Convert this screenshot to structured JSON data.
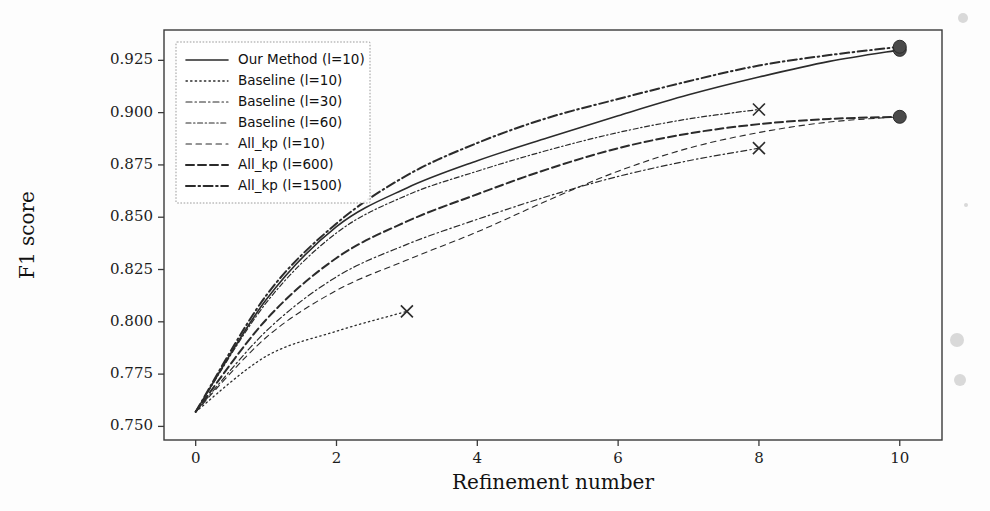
{
  "figure": {
    "background": "#fdfdfd",
    "ink_color": "#2b2b2b"
  },
  "chart_data": {
    "type": "line",
    "title": "",
    "xlabel": "Refinement number",
    "ylabel": "F1 score",
    "xlim": [
      -0.45,
      10.6
    ],
    "ylim": [
      0.7435,
      0.9395
    ],
    "xticks": [
      0,
      2,
      4,
      6,
      8,
      10
    ],
    "xticklabels": [
      "0",
      "2",
      "4",
      "6",
      "8",
      "10"
    ],
    "yticks": [
      0.75,
      0.775,
      0.8,
      0.825,
      0.85,
      0.875,
      0.9,
      0.925
    ],
    "yticklabels": [
      "0.750",
      "0.775",
      "0.800",
      "0.825",
      "0.850",
      "0.875",
      "0.900",
      "0.925"
    ],
    "grid": false,
    "legend_position": "upper left",
    "series": [
      {
        "name": "Our Method (l=10)",
        "dash": "none",
        "width": 1.6,
        "marker": "circle",
        "marker_x": [
          10
        ],
        "x": [
          0,
          1,
          2,
          3,
          4,
          5,
          6,
          7,
          8,
          9,
          10
        ],
        "y": [
          0.757,
          0.8105,
          0.8455,
          0.864,
          0.877,
          0.888,
          0.8985,
          0.9085,
          0.917,
          0.9245,
          0.93
        ]
      },
      {
        "name": "Baseline (l=10)",
        "dash": "1.4 3.2",
        "width": 1.3,
        "marker": "x",
        "marker_x": [
          3
        ],
        "x": [
          0,
          1,
          2,
          3
        ],
        "y": [
          0.757,
          0.7835,
          0.7955,
          0.805
        ]
      },
      {
        "name": "Baseline (l=30)",
        "dash": "6 3 1.5 3",
        "width": 1.2,
        "marker": "x",
        "marker_x": [
          8
        ],
        "x": [
          0,
          1,
          2,
          3,
          4,
          5,
          6,
          7,
          8
        ],
        "y": [
          0.757,
          0.7955,
          0.8215,
          0.837,
          0.849,
          0.86,
          0.8695,
          0.877,
          0.883
        ]
      },
      {
        "name": "Baseline (l=60)",
        "dash": "5 2.6 1.4 2.6",
        "width": 1.2,
        "marker": "x",
        "marker_x": [
          8
        ],
        "x": [
          0,
          1,
          2,
          3,
          4,
          5,
          6,
          7,
          8
        ],
        "y": [
          0.757,
          0.809,
          0.8425,
          0.8605,
          0.872,
          0.882,
          0.8905,
          0.897,
          0.9015
        ]
      },
      {
        "name": "All_kp (l=10)",
        "dash": "5.5 4.5",
        "width": 1.1,
        "marker": "none",
        "marker_x": [],
        "x": [
          0,
          1,
          2,
          3,
          4,
          5,
          6,
          7,
          8,
          9,
          10
        ],
        "y": [
          0.757,
          0.7925,
          0.815,
          0.8295,
          0.843,
          0.858,
          0.872,
          0.883,
          0.8905,
          0.8955,
          0.898
        ]
      },
      {
        "name": "All_kp (l=600)",
        "dash": "8 4",
        "width": 2.0,
        "marker": "circle",
        "marker_x": [
          10
        ],
        "x": [
          0,
          1,
          2,
          3,
          4,
          5,
          6,
          7,
          8,
          9,
          10
        ],
        "y": [
          0.757,
          0.801,
          0.8305,
          0.848,
          0.861,
          0.873,
          0.883,
          0.89,
          0.8945,
          0.897,
          0.898
        ]
      },
      {
        "name": "All_kp (l=1500)",
        "dash": "9 3.5 1.6 3.5",
        "width": 2.0,
        "marker": "circle",
        "marker_x": [
          10
        ],
        "x": [
          0,
          1,
          2,
          3,
          4,
          5,
          6,
          7,
          8,
          9,
          10
        ],
        "y": [
          0.757,
          0.8125,
          0.847,
          0.87,
          0.8855,
          0.8975,
          0.9065,
          0.915,
          0.9225,
          0.9275,
          0.9315
        ]
      }
    ]
  }
}
